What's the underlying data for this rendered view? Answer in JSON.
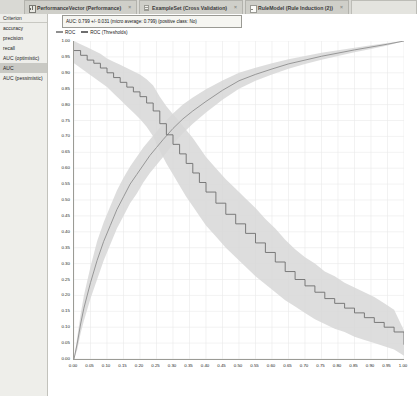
{
  "window": {
    "tabs": [
      {
        "label": "PerformanceVector (Performance)",
        "icon": "performance-icon",
        "active": true,
        "close": "×"
      },
      {
        "label": "ExampleSet (Cross Validation)",
        "icon": "exampleset-icon",
        "active": false,
        "close": "×"
      },
      {
        "label": "RuleModel (Rule Induction (2))",
        "icon": "rulemodel-icon",
        "active": false,
        "close": "×"
      }
    ]
  },
  "sidebar": {
    "header": "Criterion",
    "items": [
      {
        "label": "accuracy",
        "selected": false
      },
      {
        "label": "precision",
        "selected": false
      },
      {
        "label": "recall",
        "selected": false
      },
      {
        "label": "AUC (optimistic)",
        "selected": false
      },
      {
        "label": "AUC",
        "selected": true
      },
      {
        "label": "AUC (pessimistic)",
        "selected": false
      }
    ]
  },
  "chart_panel": {
    "auc_summary": "AUC: 0.799 +/- 0.031 (micro average: 0.799) (positive class: No)",
    "legend": [
      {
        "label": "ROC",
        "color": "#8f8f8f"
      },
      {
        "label": "ROC (Thresholds)",
        "color": "#6e6e6e"
      }
    ]
  },
  "chart_data": {
    "type": "line",
    "title": "",
    "xlabel": "",
    "ylabel": "",
    "xlim": [
      0,
      1
    ],
    "ylim": [
      0,
      1
    ],
    "grid": true,
    "legend_position": "top-left",
    "xticks": [
      "0.00",
      "0.05",
      "0.10",
      "0.15",
      "0.20",
      "0.25",
      "0.30",
      "0.35",
      "0.40",
      "0.45",
      "0.50",
      "0.55",
      "0.60",
      "0.65",
      "0.70",
      "0.75",
      "0.80",
      "0.85",
      "0.90",
      "0.95",
      "1.00"
    ],
    "yticks": [
      "0.00",
      "0.05",
      "0.10",
      "0.15",
      "0.20",
      "0.25",
      "0.30",
      "0.35",
      "0.40",
      "0.45",
      "0.50",
      "0.55",
      "0.60",
      "0.65",
      "0.70",
      "0.75",
      "0.80",
      "0.85",
      "0.90",
      "0.95",
      "1.00"
    ],
    "series": [
      {
        "name": "ROC",
        "color": "#8f8f8f",
        "band_color": "#d7d7d7",
        "x": [
          0.0,
          0.01,
          0.02,
          0.03,
          0.05,
          0.07,
          0.09,
          0.11,
          0.13,
          0.15,
          0.17,
          0.19,
          0.21,
          0.23,
          0.25,
          0.27,
          0.3,
          0.33,
          0.36,
          0.4,
          0.45,
          0.5,
          0.55,
          0.6,
          0.65,
          0.7,
          0.75,
          0.8,
          0.85,
          0.9,
          0.95,
          1.0
        ],
        "y": [
          0.0,
          0.05,
          0.11,
          0.16,
          0.24,
          0.31,
          0.37,
          0.42,
          0.47,
          0.51,
          0.55,
          0.58,
          0.61,
          0.64,
          0.665,
          0.69,
          0.725,
          0.755,
          0.78,
          0.81,
          0.845,
          0.875,
          0.895,
          0.912,
          0.928,
          0.94,
          0.952,
          0.962,
          0.972,
          0.981,
          0.99,
          1.0
        ],
        "band_lo": [
          0.0,
          0.03,
          0.08,
          0.12,
          0.19,
          0.25,
          0.31,
          0.36,
          0.41,
          0.45,
          0.49,
          0.52,
          0.555,
          0.585,
          0.61,
          0.635,
          0.675,
          0.71,
          0.74,
          0.775,
          0.815,
          0.85,
          0.875,
          0.895,
          0.913,
          0.928,
          0.941,
          0.953,
          0.965,
          0.975,
          0.986,
          1.0
        ],
        "band_hi": [
          0.0,
          0.07,
          0.14,
          0.2,
          0.29,
          0.37,
          0.43,
          0.48,
          0.53,
          0.57,
          0.605,
          0.635,
          0.665,
          0.69,
          0.715,
          0.74,
          0.772,
          0.8,
          0.822,
          0.848,
          0.876,
          0.9,
          0.916,
          0.93,
          0.943,
          0.953,
          0.963,
          0.971,
          0.979,
          0.987,
          0.994,
          1.0
        ]
      },
      {
        "name": "ROC (Thresholds)",
        "color": "#6e6e6e",
        "band_color": "#d7d7d7",
        "x": [
          0.0,
          0.02,
          0.04,
          0.06,
          0.08,
          0.1,
          0.12,
          0.14,
          0.16,
          0.18,
          0.2,
          0.22,
          0.24,
          0.26,
          0.28,
          0.3,
          0.32,
          0.34,
          0.36,
          0.38,
          0.4,
          0.43,
          0.46,
          0.49,
          0.52,
          0.55,
          0.58,
          0.61,
          0.64,
          0.67,
          0.7,
          0.73,
          0.76,
          0.79,
          0.82,
          0.85,
          0.88,
          0.91,
          0.94,
          0.97,
          1.0
        ],
        "y": [
          0.97,
          0.955,
          0.94,
          0.93,
          0.915,
          0.9,
          0.885,
          0.87,
          0.855,
          0.84,
          0.825,
          0.805,
          0.78,
          0.74,
          0.705,
          0.675,
          0.645,
          0.615,
          0.585,
          0.555,
          0.525,
          0.49,
          0.455,
          0.425,
          0.395,
          0.365,
          0.335,
          0.305,
          0.275,
          0.25,
          0.23,
          0.21,
          0.19,
          0.175,
          0.16,
          0.145,
          0.13,
          0.115,
          0.1,
          0.085,
          0.045
        ],
        "band_lo": [
          0.93,
          0.915,
          0.9,
          0.885,
          0.87,
          0.855,
          0.835,
          0.815,
          0.795,
          0.775,
          0.755,
          0.73,
          0.7,
          0.655,
          0.615,
          0.58,
          0.545,
          0.51,
          0.48,
          0.45,
          0.42,
          0.385,
          0.35,
          0.32,
          0.29,
          0.26,
          0.235,
          0.21,
          0.185,
          0.165,
          0.145,
          0.125,
          0.11,
          0.095,
          0.085,
          0.07,
          0.06,
          0.05,
          0.04,
          0.03,
          0.01
        ],
        "band_hi": [
          1.0,
          0.99,
          0.98,
          0.97,
          0.96,
          0.945,
          0.935,
          0.925,
          0.915,
          0.905,
          0.895,
          0.88,
          0.86,
          0.825,
          0.795,
          0.77,
          0.745,
          0.72,
          0.695,
          0.665,
          0.635,
          0.6,
          0.565,
          0.535,
          0.505,
          0.475,
          0.44,
          0.41,
          0.375,
          0.345,
          0.32,
          0.3,
          0.275,
          0.26,
          0.24,
          0.225,
          0.21,
          0.195,
          0.175,
          0.155,
          0.09
        ]
      }
    ]
  }
}
